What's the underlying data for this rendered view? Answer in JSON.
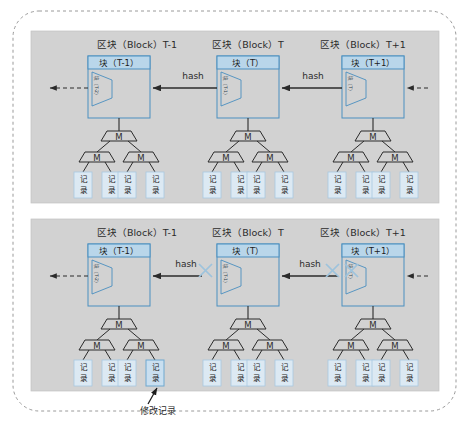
{
  "figure": {
    "background_color": "#ffffff",
    "outer_border_color": "#9a9a9a",
    "panel_fill": "#d2d2d2",
    "panel_border": "#b9b9b9",
    "block_header_fill": "#b9d6ea",
    "block_border": "#4a8fc0",
    "block_body_fill": "#d2d2d2",
    "record_fill": "#dce9f3",
    "record_border": "#a9c9e0",
    "line_color": "#2b2b2b",
    "x_mark_color": "#9dc3dd",
    "annotation_arrow_color": "#1c1c1c"
  },
  "panels": [
    {
      "id": "intact-chain",
      "name": "top-panel",
      "blocks": [
        {
          "title": "区块（Block）T-1",
          "header_label": "块（T-1）",
          "prev_hash_label": "块（T-2）",
          "merkle_root_label": "M",
          "merkle_children": [
            "M",
            "M"
          ],
          "records": [
            "记录",
            "记录",
            "记录",
            "记录"
          ]
        },
        {
          "title": "区块（Block）T",
          "header_label": "块（T）",
          "prev_hash_label": "块（T-1）",
          "merkle_root_label": "M",
          "merkle_children": [
            "M",
            "M"
          ],
          "records": [
            "记录",
            "记录",
            "记录",
            "记录"
          ]
        },
        {
          "title": "区块（Block）T+1",
          "header_label": "块（T+1）",
          "prev_hash_label": "块（T）",
          "merkle_root_label": "M",
          "merkle_children": [
            "M",
            "M"
          ],
          "records": [
            "记录",
            "记录",
            "记录",
            "记录"
          ]
        }
      ],
      "hash_links": [
        {
          "label": "hash",
          "broken": false
        },
        {
          "label": "hash",
          "broken": false
        }
      ]
    },
    {
      "id": "tampered-chain",
      "name": "bottom-panel",
      "blocks": [
        {
          "title": "区块（Block）T-1",
          "header_label": "块（T-1）",
          "prev_hash_label": "块（T-2）",
          "merkle_root_label": "M",
          "merkle_children": [
            "M",
            "M"
          ],
          "records": [
            "记录",
            "记录",
            "记录",
            "记录"
          ]
        },
        {
          "title": "区块（Block）T",
          "header_label": "块（T）",
          "prev_hash_label": "块（T-1）",
          "merkle_root_label": "M",
          "merkle_children": [
            "M",
            "M"
          ],
          "records": [
            "记录",
            "记录",
            "记录",
            "记录"
          ]
        },
        {
          "title": "区块（Block）T+1",
          "header_label": "块（T+1）",
          "prev_hash_label": "块（T）",
          "merkle_root_label": "M",
          "merkle_children": [
            "M",
            "M"
          ],
          "records": [
            "记录",
            "记录",
            "记录",
            "记录"
          ]
        }
      ],
      "hash_links": [
        {
          "label": "hash",
          "broken": true
        },
        {
          "label": "hash",
          "broken": true
        }
      ],
      "annotation": {
        "label": "修改记录",
        "target_block_index": 0,
        "target_record_index": 3
      }
    }
  ]
}
